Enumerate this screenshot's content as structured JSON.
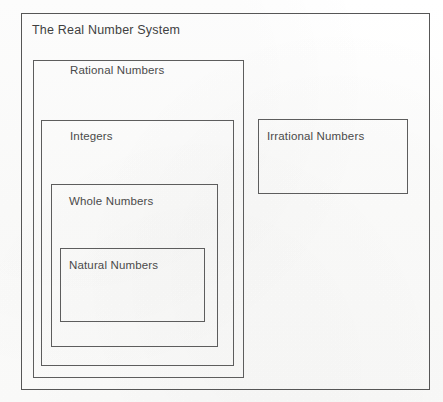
{
  "diagram": {
    "title": "The Real Number System",
    "type": "nested-set-venn-diagram",
    "background_color": "#fdfdfc",
    "line_color": "#5d5d5d",
    "text_color": "#4a4a4a",
    "sets": [
      {
        "id": "real-numbers",
        "label": "The Real Number System",
        "level": 0,
        "box": {
          "x": 21,
          "y": 13,
          "width": 409,
          "height": 377
        },
        "label_position": {
          "x": 32,
          "y": 24
        }
      },
      {
        "id": "rational-numbers",
        "label": "Rational Numbers",
        "level": 1,
        "box": {
          "x": 33,
          "y": 60,
          "width": 211,
          "height": 318
        },
        "label_position": {
          "x": 70,
          "y": 64
        }
      },
      {
        "id": "integers",
        "label": "Integers",
        "level": 2,
        "box": {
          "x": 41,
          "y": 120,
          "width": 193,
          "height": 246
        },
        "label_position": {
          "x": 70,
          "y": 130
        }
      },
      {
        "id": "whole-numbers",
        "label": "Whole Numbers",
        "level": 3,
        "box": {
          "x": 51,
          "y": 184,
          "width": 167,
          "height": 163
        },
        "label_position": {
          "x": 69,
          "y": 195
        }
      },
      {
        "id": "natural-numbers",
        "label": "Natural Numbers",
        "level": 4,
        "box": {
          "x": 60,
          "y": 248,
          "width": 145,
          "height": 74
        },
        "label_position": {
          "x": 69,
          "y": 259
        }
      },
      {
        "id": "irrational-numbers",
        "label": "Irrational Numbers",
        "level": 1,
        "box": {
          "x": 258,
          "y": 119,
          "width": 150,
          "height": 75
        },
        "label_position": {
          "x": 267,
          "y": 130
        }
      }
    ]
  }
}
